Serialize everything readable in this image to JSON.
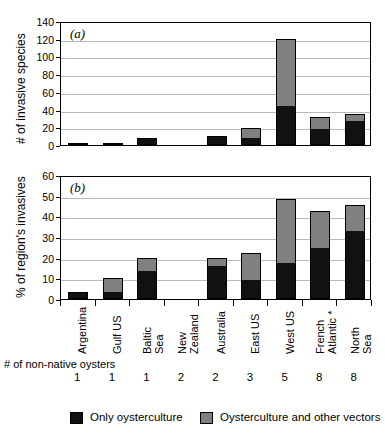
{
  "figure": {
    "panel_a_letter": "(a)",
    "panel_b_letter": "(b)",
    "panel_a_ylabel": "# of invasive species",
    "panel_b_ylabel": "% of region's invasives",
    "oyster_row_label_line1": "# of",
    "oyster_row_label_line2": "non-native",
    "oyster_row_label_line3": "oysters"
  },
  "legend": {
    "black_label": "Only oysterculture",
    "gray_label": "Oysterculture and other vectors",
    "black_color": "#111111",
    "gray_color": "#808080"
  },
  "categories": [
    {
      "label_lines": [
        "Argentina"
      ],
      "oysters": "1"
    },
    {
      "label_lines": [
        "Gulf US"
      ],
      "oysters": "1"
    },
    {
      "label_lines": [
        "Baltic",
        "Sea"
      ],
      "oysters": "1"
    },
    {
      "label_lines": [
        "New",
        "Zealand"
      ],
      "oysters": "2"
    },
    {
      "label_lines": [
        "Australia"
      ],
      "oysters": "2"
    },
    {
      "label_lines": [
        "East US"
      ],
      "oysters": "3"
    },
    {
      "label_lines": [
        "West US"
      ],
      "oysters": "5"
    },
    {
      "label_lines": [
        "French",
        "Atlantic *"
      ],
      "oysters": "8"
    },
    {
      "label_lines": [
        "North",
        "Sea"
      ],
      "oysters": "8"
    }
  ],
  "chart_data": [
    {
      "type": "bar",
      "panel": "(a)",
      "stacked": true,
      "title": "",
      "xlabel": "",
      "ylabel": "# of invasive species",
      "ylim": [
        0,
        140
      ],
      "yticks": [
        0,
        20,
        40,
        60,
        80,
        100,
        120,
        140
      ],
      "grid": true,
      "legend_position": "below-figure",
      "categories": [
        "Argentina",
        "Gulf US",
        "Baltic Sea",
        "New Zealand",
        "Australia",
        "East US",
        "West US",
        "French Atlantic *",
        "North Sea"
      ],
      "series": [
        {
          "name": "Only oysterculture",
          "color": "#111111",
          "values": [
            1,
            2,
            7,
            0,
            10,
            8,
            44,
            18,
            27
          ]
        },
        {
          "name": "Oysterculture and other vectors",
          "color": "#808080",
          "values": [
            0,
            0,
            1,
            0,
            0,
            11,
            76,
            14,
            8
          ]
        }
      ],
      "totals": [
        1,
        2,
        8,
        0,
        10,
        19,
        120,
        32,
        35
      ]
    },
    {
      "type": "bar",
      "panel": "(b)",
      "stacked": true,
      "title": "",
      "xlabel": "",
      "ylabel": "% of region's invasives",
      "ylim": [
        0,
        60
      ],
      "yticks": [
        0,
        10,
        20,
        30,
        40,
        50,
        60
      ],
      "grid": true,
      "legend_position": "below-figure",
      "categories": [
        "Argentina",
        "Gulf US",
        "Baltic Sea",
        "New Zealand",
        "Australia",
        "East US",
        "West US",
        "French Atlantic *",
        "North Sea"
      ],
      "series": [
        {
          "name": "Only oysterculture",
          "color": "#111111",
          "values": [
            3.3,
            3.5,
            13.5,
            0,
            16.0,
            9.0,
            17.5,
            24.5,
            33.0
          ]
        },
        {
          "name": "Oysterculture and other vectors",
          "color": "#808080",
          "values": [
            0,
            6.5,
            6.5,
            0,
            4.0,
            13.3,
            31.0,
            18.0,
            12.3
          ]
        }
      ],
      "totals": [
        3.3,
        10.0,
        20.0,
        0,
        20.0,
        22.3,
        48.5,
        42.5,
        45.3
      ]
    }
  ],
  "oyster_counts": [
    "1",
    "1",
    "1",
    "2",
    "2",
    "3",
    "5",
    "8",
    "8"
  ]
}
